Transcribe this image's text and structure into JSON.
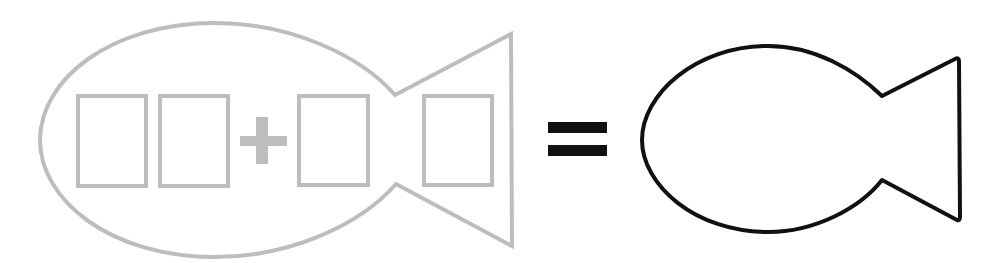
{
  "diagram": {
    "colors": {
      "background": "#ffffff",
      "puzzle_stroke": "#bdbdbd",
      "answer_stroke": "#111111",
      "equals_fill": "#111111"
    },
    "left_fish": {
      "label": "problem-fish",
      "boxes": [
        {
          "id": "tens-digit-box",
          "value": ""
        },
        {
          "id": "ones-digit-box",
          "value": ""
        },
        {
          "id": "addend-box",
          "value": ""
        },
        {
          "id": "tail-box",
          "value": ""
        }
      ],
      "operator": "+"
    },
    "equals_sign": "=",
    "right_fish": {
      "label": "answer-fish",
      "value": ""
    }
  }
}
